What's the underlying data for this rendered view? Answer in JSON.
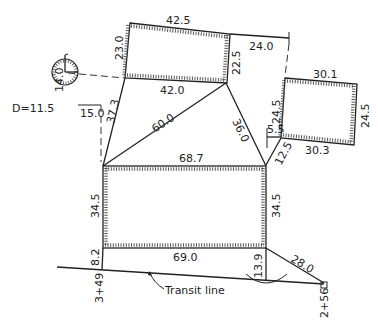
{
  "diagram": {
    "type": "survey-plot-tie-measurements",
    "buildings": {
      "top_building": {
        "top": "42.5",
        "left": "23.0",
        "right": "22.5",
        "bottom": "42.0"
      },
      "right_building": {
        "top": "30.1",
        "left": "24.5",
        "right": "24.5",
        "bottom": "30.3"
      },
      "main_building": {
        "top": "68.7",
        "left": "34.5",
        "right": "34.5",
        "bottom": "69.0"
      }
    },
    "ties": {
      "tie_24_0": "24.0",
      "tie_37_3": "37.3",
      "tie_60_0": "60.0",
      "tie_36_0": "36.0",
      "tie_5_5": "5.5",
      "tie_12_5": "12.5",
      "tie_8_2": "8.2",
      "tie_13_9": "13.9",
      "tie_28_0": "28.0"
    },
    "tree": {
      "diameter_label": "D=11.5",
      "tie_vertical": "14.0",
      "tie_horizontal": "15.0"
    },
    "stations": {
      "left": "3+49",
      "right": "2+56"
    },
    "transit_line_label": "Transit line"
  }
}
